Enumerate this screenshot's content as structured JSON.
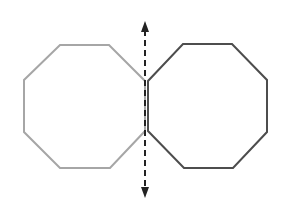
{
  "diagram": {
    "left_octagon": {
      "stroke": "#a6a6a6",
      "label": ""
    },
    "right_octagon": {
      "stroke": "#4d4d4d",
      "label": ""
    },
    "symmetry_line": {
      "style": "dashed",
      "color": "#222222",
      "arrows": "both-ends"
    }
  }
}
